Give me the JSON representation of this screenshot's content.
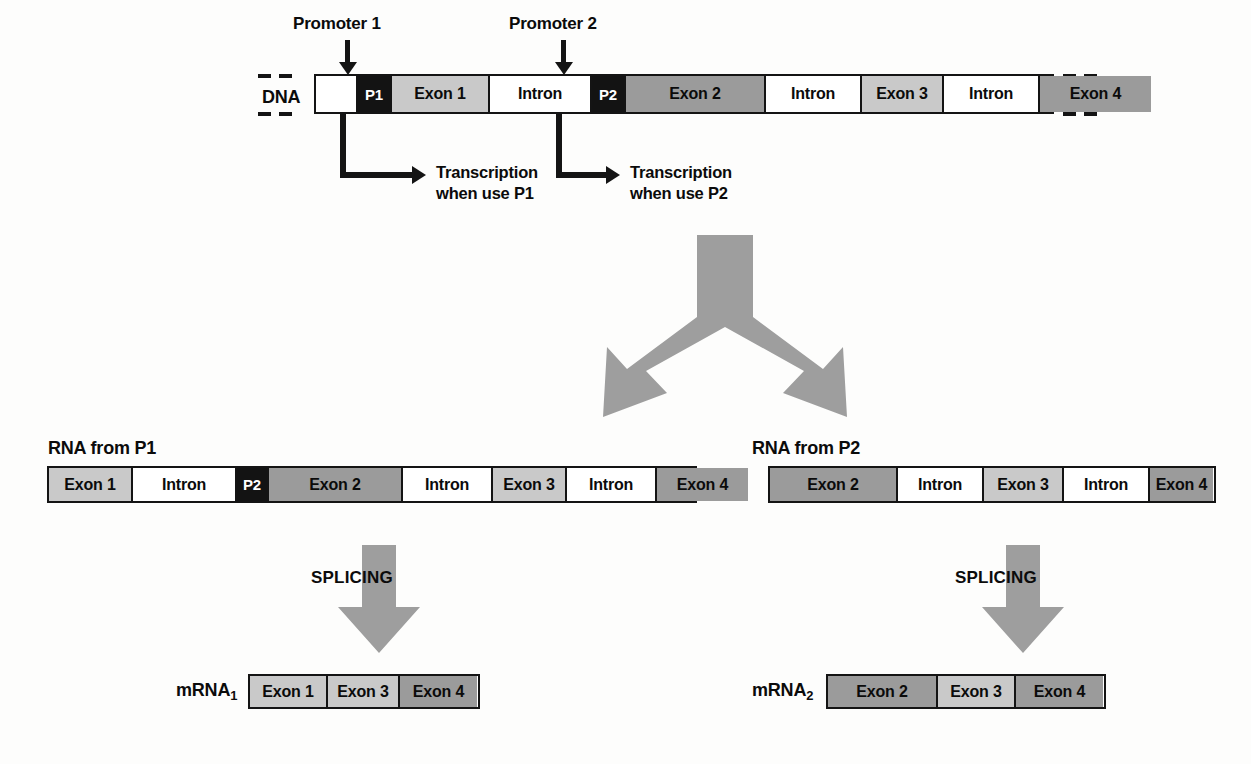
{
  "figure": {
    "colors": {
      "exon_light": "#c9c9c9",
      "exon_dark": "#9b9b9b",
      "intron": "#ffffff",
      "promoter": "#131313",
      "outline": "#141414",
      "gray_arrow": "#9e9e9e"
    }
  },
  "promoter_callouts": [
    {
      "label": "Promoter 1",
      "target": "P1"
    },
    {
      "label": "Promoter 2",
      "target": "P2"
    }
  ],
  "dna": {
    "label": "DNA",
    "segments": [
      {
        "text": "",
        "kind": "empty"
      },
      {
        "text": "P1",
        "kind": "promoter"
      },
      {
        "text": "Exon 1",
        "kind": "exon_light"
      },
      {
        "text": "Intron",
        "kind": "intron"
      },
      {
        "text": "P2",
        "kind": "promoter"
      },
      {
        "text": "Exon 2",
        "kind": "exon_dark"
      },
      {
        "text": "Intron",
        "kind": "intron"
      },
      {
        "text": "Exon 3",
        "kind": "exon_light"
      },
      {
        "text": "Intron",
        "kind": "intron"
      },
      {
        "text": "Exon 4",
        "kind": "exon_dark"
      }
    ]
  },
  "transcription": [
    {
      "line1": "Transcription",
      "line2": "when use P1"
    },
    {
      "line1": "Transcription",
      "line2": "when use P2"
    }
  ],
  "rna_p1": {
    "label": "RNA from P1",
    "segments": [
      {
        "text": "Exon 1",
        "kind": "exon_light"
      },
      {
        "text": "Intron",
        "kind": "intron"
      },
      {
        "text": "P2",
        "kind": "promoter"
      },
      {
        "text": "Exon 2",
        "kind": "exon_dark"
      },
      {
        "text": "Intron",
        "kind": "intron"
      },
      {
        "text": "Exon 3",
        "kind": "exon_light"
      },
      {
        "text": "Intron",
        "kind": "intron"
      },
      {
        "text": "Exon 4",
        "kind": "exon_dark"
      }
    ]
  },
  "rna_p2": {
    "label": "RNA from P2",
    "segments": [
      {
        "text": "Exon 2",
        "kind": "exon_dark"
      },
      {
        "text": "Intron",
        "kind": "intron"
      },
      {
        "text": "Exon 3",
        "kind": "exon_light"
      },
      {
        "text": "Intron",
        "kind": "intron"
      },
      {
        "text": "Exon 4",
        "kind": "exon_dark"
      }
    ]
  },
  "splicing": {
    "left_label": "SPLICING",
    "right_label": "SPLICING"
  },
  "mrna_1": {
    "label_main": "mRNA",
    "label_sub": "1",
    "segments": [
      {
        "text": "Exon 1",
        "kind": "exon_light"
      },
      {
        "text": "Exon 3",
        "kind": "exon_light"
      },
      {
        "text": "Exon 4",
        "kind": "exon_dark"
      }
    ]
  },
  "mrna_2": {
    "label_main": "mRNA",
    "label_sub": "2",
    "segments": [
      {
        "text": "Exon 2",
        "kind": "exon_dark"
      },
      {
        "text": "Exon 3",
        "kind": "exon_light"
      },
      {
        "text": "Exon 4",
        "kind": "exon_dark"
      }
    ]
  }
}
